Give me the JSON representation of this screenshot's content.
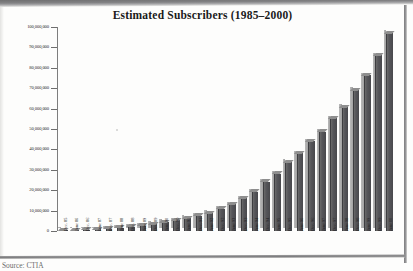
{
  "document": {
    "source_note": "Source: CTIA"
  },
  "chart_data": {
    "type": "bar",
    "title": "Estimated Subscribers (1985–2000)",
    "xlabel": "",
    "ylabel": "",
    "ylim": [
      0,
      100000000
    ],
    "grid": false,
    "legend": null,
    "y_ticks": [
      {
        "value": 0,
        "label": "0"
      },
      {
        "value": 10000000,
        "label": "10,000,000"
      },
      {
        "value": 20000000,
        "label": "20,000,000"
      },
      {
        "value": 30000000,
        "label": "30,000,000"
      },
      {
        "value": 40000000,
        "label": "40,000,000"
      },
      {
        "value": 50000000,
        "label": "50,000,000"
      },
      {
        "value": 60000000,
        "label": "60,000,000"
      },
      {
        "value": 70000000,
        "label": "70,000,000"
      },
      {
        "value": 80000000,
        "label": "80,000,000"
      },
      {
        "value": 90000000,
        "label": "90,000,000"
      },
      {
        "value": 100000000,
        "label": "100,000,000"
      }
    ],
    "categories": [
      "Dec. 85",
      "June 86",
      "Dec. 86",
      "June 87",
      "Dec. 87",
      "June 88",
      "Dec. 88",
      "June 89",
      "Dec. 89",
      "June 90",
      "Dec. 90",
      "June 91",
      "Dec. 91",
      "June 92",
      "Dec. 92",
      "June 93",
      "Dec. 93",
      "June 94",
      "Dec. 94",
      "June 95",
      "Dec. 95",
      "June 96",
      "Dec. 96",
      "June 97",
      "Dec. 97",
      "June 98",
      "Dec. 98",
      "June 99",
      "Dec. 99",
      "June 00"
    ],
    "values": [
      340213,
      500000,
      681825,
      883000,
      1230855,
      1600000,
      2069441,
      2700000,
      3508944,
      4400000,
      5283055,
      6380000,
      7557148,
      8900000,
      11032753,
      13000000,
      16009461,
      19300000,
      24134421,
      28154415,
      33785661,
      38195000,
      44042992,
      48705000,
      55312293,
      60831431,
      69209321,
      76284753,
      86047003,
      97035925
    ],
    "bar_color": "#4f4f53",
    "bar_side_color": "#aaaaaa",
    "bar_top_color": "#8e8e8e"
  }
}
